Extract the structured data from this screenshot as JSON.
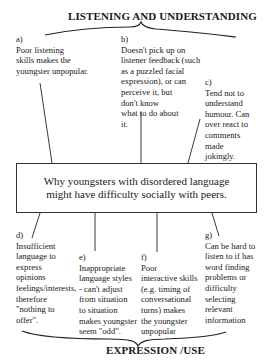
{
  "top_heading": "LISTENING AND UNDERSTANDING",
  "bottom_heading": "EXPRESSION /USE",
  "central_box": {
    "lines": [
      "Why youngsters with disordered language",
      "might have difficulty socially with peers."
    ]
  },
  "notes": [
    {
      "id": "a",
      "label": "a)",
      "lines": [
        "Poor listening",
        "skills makes the",
        "youngster unpopular."
      ]
    },
    {
      "id": "b",
      "label": "b)",
      "lines": [
        "Doesn't pick up on",
        "listener feedback (such",
        "as a puzzled facial",
        "expression), or can",
        "perceive it, but",
        "don't know",
        "what to do about",
        "it."
      ]
    },
    {
      "id": "c",
      "label": "c)",
      "lines": [
        "Tend not to",
        "understand",
        "humour.  Can",
        "over react to",
        "comments",
        "made",
        "jokingly."
      ]
    },
    {
      "id": "d",
      "label": "d)",
      "lines": [
        "Insufficient",
        "language to",
        "express",
        "opinions",
        "feelings/interests,",
        "therefore",
        "\"nothing to",
        "offer\"."
      ]
    },
    {
      "id": "e",
      "label": "e)",
      "lines": [
        "Inappropriate",
        "language styles",
        "- can't adjust",
        "from situation",
        "to situation",
        "makes youngster",
        "seem \"odd\"."
      ]
    },
    {
      "id": "f",
      "label": "f)",
      "lines": [
        "Poor",
        "interactive skills",
        "(e.g. timing of",
        "conversational",
        "turns) makes",
        "the youngster",
        "unpopular"
      ]
    },
    {
      "id": "g",
      "label": "g)",
      "lines": [
        "Can be hard to",
        "listen to if has",
        "word finding",
        "problems or",
        "difficulty",
        "selecting",
        "relevant",
        "information"
      ]
    }
  ],
  "colors": {
    "ink": "#1a1a1a",
    "background": "#ffffff"
  }
}
